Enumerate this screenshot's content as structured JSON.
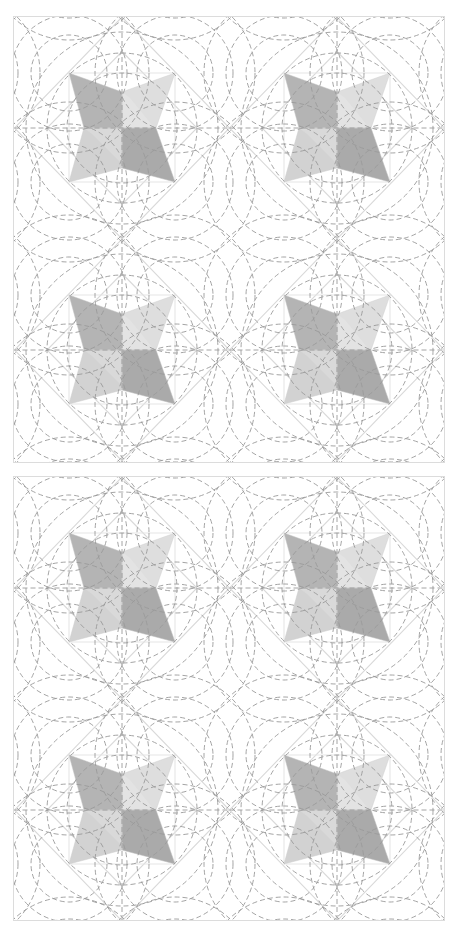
{
  "figure": {
    "colors": {
      "background": "#ffffff",
      "border": "#dcdcdc",
      "lattice_line": "#d9d9d9",
      "dashed_line": "#9a9a9a",
      "arm_dark": "#b4b4b4",
      "arm_light": "#dedede",
      "arm_mid": "#d2d2d2",
      "arm_darker": "#aaaaaa"
    },
    "panels": [
      {
        "name": "top-panel",
        "x": 14,
        "y": 17,
        "width": 430,
        "height": 445,
        "stars": [
          {
            "cx": 108,
            "cy": 111
          },
          {
            "cx": 323,
            "cy": 111
          },
          {
            "cx": 108,
            "cy": 333
          },
          {
            "cx": 323,
            "cy": 333
          }
        ]
      },
      {
        "name": "bottom-panel",
        "x": 14,
        "y": 477,
        "width": 430,
        "height": 443,
        "stars": [
          {
            "cx": 108,
            "cy": 111
          },
          {
            "cx": 323,
            "cy": 111
          },
          {
            "cx": 108,
            "cy": 333
          },
          {
            "cx": 323,
            "cy": 333
          }
        ]
      }
    ],
    "geometry": {
      "cell_w": 215,
      "cell_h": 222,
      "tip_dx": 53,
      "tip_dy_top": 55,
      "tip_dy_bottom": 54,
      "inner_top": 36,
      "inner_left": 38,
      "inner_right": 34,
      "inner_bottom": 40,
      "center_circle_radii": [
        55,
        75,
        96
      ],
      "tip_circle_radii": [
        38,
        58,
        80
      ],
      "dash": "5 3"
    }
  }
}
